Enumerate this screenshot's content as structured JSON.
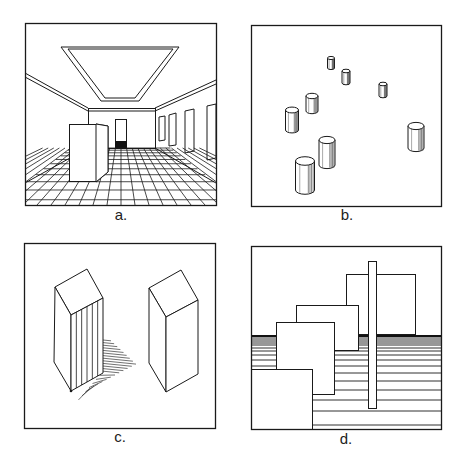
{
  "figure": {
    "panels": [
      {
        "id": "a",
        "label": "a.",
        "description": "One-point perspective interior room with tiled floor, ceiling skylight, wall windows, far doorway and a box in foreground"
      },
      {
        "id": "b",
        "label": "b.",
        "description": "Cylinders of varying size scattered on a plane; size indicating depth"
      },
      {
        "id": "c",
        "label": "c.",
        "description": "Two rectangular prisms; left one shaded with vertical lines and casting a hatched shadow, right one unshaded"
      },
      {
        "id": "d",
        "label": "d.",
        "description": "Overlapping rectangles in front of horizontal lines with texture-gradient spacing; a tall thin vertical bar"
      }
    ]
  },
  "colors": {
    "ink": "#1a1a1a",
    "background": "#ffffff",
    "dark_fill": "#111111"
  }
}
